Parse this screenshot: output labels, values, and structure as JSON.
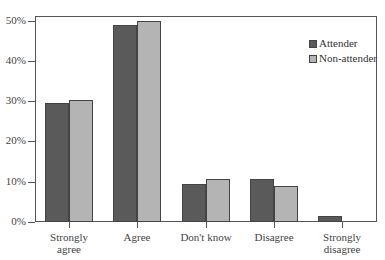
{
  "chart_data": {
    "type": "bar",
    "title": "",
    "xlabel": "",
    "ylabel": "",
    "ylim": [
      0,
      50
    ],
    "yticks": [
      "0%",
      "10%",
      "20%",
      "30%",
      "40%",
      "50%"
    ],
    "categories": [
      "Strongly agree",
      "Agree",
      "Don't know",
      "Disagree",
      "Strongly disagree"
    ],
    "category_lines": [
      [
        "Strongly",
        "agree"
      ],
      [
        "Agree"
      ],
      [
        "Don't know"
      ],
      [
        "Disagree"
      ],
      [
        "Strongly",
        "disagree"
      ]
    ],
    "series": [
      {
        "name": "Attender",
        "color": "#5a5a5a",
        "values": [
          29.6,
          48.9,
          9.4,
          10.8,
          1.4
        ]
      },
      {
        "name": "Non-attender",
        "color": "#b4b4b4",
        "values": [
          30.3,
          50.0,
          10.7,
          8.9,
          0
        ]
      }
    ],
    "legend_position": "upper right",
    "grid": false
  }
}
